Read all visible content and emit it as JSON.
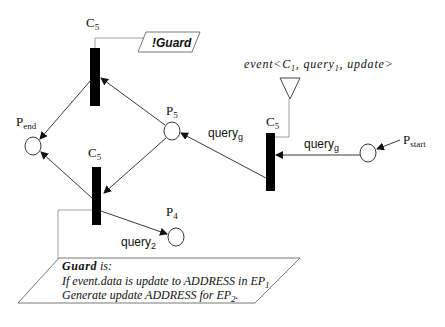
{
  "diagram": {
    "type": "petri-net",
    "transitions": [
      {
        "id": "t_top",
        "label": "C",
        "sub": "5"
      },
      {
        "id": "t_bottom",
        "label": "C",
        "sub": "5"
      },
      {
        "id": "t_right",
        "label": "C",
        "sub": "5"
      }
    ],
    "places": [
      {
        "id": "p_end",
        "label": "P",
        "sub": "end"
      },
      {
        "id": "p5",
        "label": "P",
        "sub": "5"
      },
      {
        "id": "p4",
        "label": "P",
        "sub": "4"
      },
      {
        "id": "p_start",
        "label": "P",
        "sub": "start"
      }
    ],
    "arcs": [
      {
        "id": "a_start_right",
        "label": "query",
        "sub": "g"
      },
      {
        "id": "a_right_p5",
        "label": "query",
        "sub": "g"
      },
      {
        "id": "a_bottom_p4",
        "label": "query",
        "sub": "2"
      }
    ],
    "guard_not": {
      "label": "!Guard"
    },
    "event": {
      "prefix": "event<C",
      "sub1": "1",
      "mid": ", query",
      "sub2": "1",
      "suffix": ", update>"
    },
    "guard_box": {
      "title_bold": "Guard",
      "title_rest": " is:",
      "line1_text": "If event.data is update to ADDRESS in EP",
      "line1_sub": "1",
      "line2_text": "Generate update ADDRESS for EP",
      "line2_sub": "2",
      "line2_end": "."
    }
  },
  "colors": {
    "line": "#222222",
    "thin_line": "#888888",
    "bar": "#000000",
    "background": "#ffffff"
  }
}
